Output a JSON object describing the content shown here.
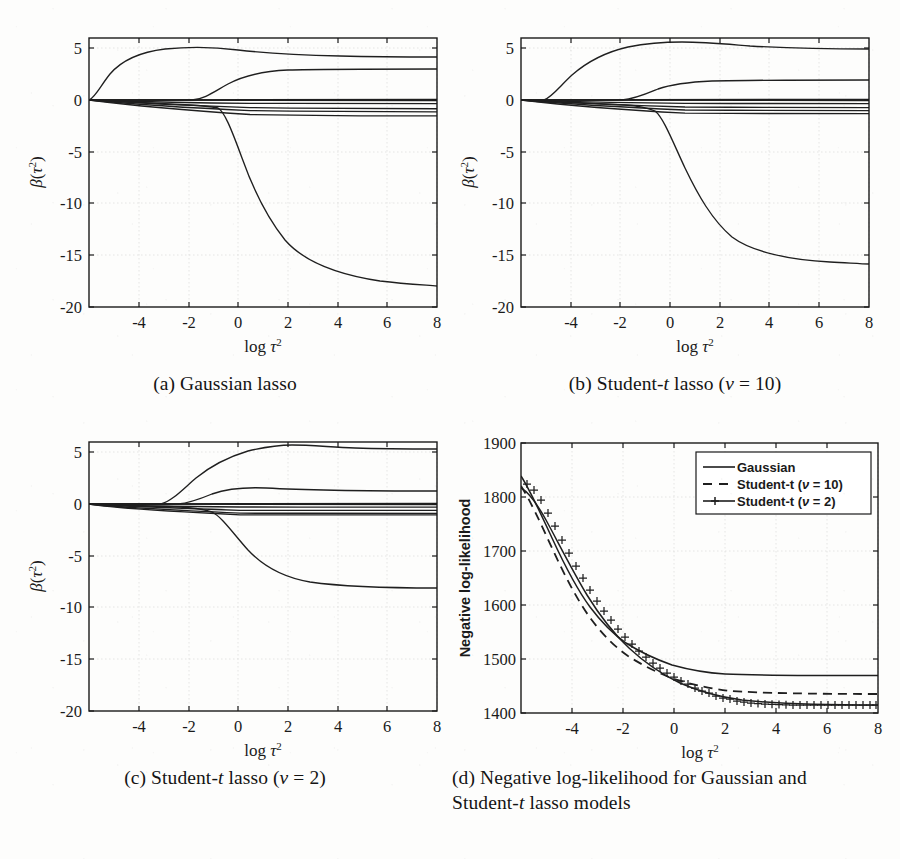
{
  "figure": {
    "background_color": "#fdfdfc",
    "ink_color": "#1a1a1a",
    "grid_color": "#d8d8d8"
  },
  "panels": [
    {
      "key": "a",
      "caption_prefix": "(a)",
      "caption_text": "Gaussian lasso"
    },
    {
      "key": "b",
      "caption_prefix": "(b)",
      "caption_text": "Student-t lasso (ν = 10)"
    },
    {
      "key": "c",
      "caption_prefix": "(c)",
      "caption_text": "Student-t lasso (ν = 2)"
    },
    {
      "key": "d",
      "caption_prefix": "(d)",
      "caption_text": "Negative log-likelihood for Gaussian and Student-t lasso models"
    }
  ],
  "axis_labels": {
    "x": "log τ²",
    "y_coef": "β(τ²)",
    "y_nll": "Negative log-likelihood"
  },
  "legend": {
    "position": "top-right",
    "items": [
      {
        "label": "Gaussian",
        "style": "solid"
      },
      {
        "label": "Student-t (ν = 10)",
        "style": "dashed"
      },
      {
        "label": "Student-t (ν = 2)",
        "style": "solid-plus-markers"
      }
    ]
  },
  "chart_data": [
    {
      "type": "line",
      "panel": "a",
      "title": "(a) Gaussian lasso",
      "xlabel": "log τ²",
      "ylabel": "β(τ²)",
      "xlim": [
        -5,
        9
      ],
      "ylim": [
        -20,
        6
      ],
      "xticks": [
        -4,
        -2,
        0,
        2,
        4,
        6,
        8
      ],
      "yticks": [
        5,
        0,
        -5,
        -10,
        -15,
        -20
      ],
      "grid": true,
      "legend": null,
      "x": [
        -5,
        -4.5,
        -4,
        -3.5,
        -3,
        -2.5,
        -2,
        -1.5,
        -1,
        -0.5,
        0,
        1,
        2,
        3,
        4,
        5,
        6,
        7,
        8,
        9
      ],
      "series": [
        {
          "name": "beta-1 (rises to ~4.2 then settles ~3.6)",
          "values": [
            0.0,
            0.6,
            1.9,
            2.9,
            3.5,
            3.9,
            4.1,
            4.2,
            4.25,
            4.25,
            4.2,
            4.0,
            3.85,
            3.75,
            3.7,
            3.67,
            3.65,
            3.63,
            3.62,
            3.6
          ]
        },
        {
          "name": "beta-2 (enters near -1.9, settles ~2.3)",
          "values": [
            0.0,
            0.0,
            0.0,
            0.0,
            0.0,
            0.0,
            0.0,
            0.55,
            1.2,
            1.7,
            2.0,
            2.25,
            2.3,
            2.3,
            2.3,
            2.3,
            2.3,
            2.3,
            2.3,
            2.3
          ]
        },
        {
          "name": "beta-3 (large negative, settles ~-17.8)",
          "values": [
            0.0,
            -0.05,
            -0.1,
            -0.15,
            -0.2,
            -0.28,
            -0.35,
            -0.45,
            -0.55,
            -0.7,
            -3.2,
            -8.4,
            -12.3,
            -14.8,
            -16.2,
            -17.0,
            -17.4,
            -17.6,
            -17.72,
            -17.8
          ]
        },
        {
          "name": "beta-4 (near zero, ~-0.05)",
          "values": [
            0.0,
            -0.01,
            -0.02,
            -0.03,
            -0.03,
            -0.04,
            -0.04,
            -0.05,
            -0.05,
            -0.05,
            -0.05,
            -0.05,
            -0.05,
            -0.05,
            -0.05,
            -0.05,
            -0.05,
            -0.05,
            -0.05,
            -0.05
          ]
        },
        {
          "name": "beta-5 (settles ~-0.35)",
          "values": [
            0.0,
            -0.05,
            -0.1,
            -0.14,
            -0.18,
            -0.21,
            -0.24,
            -0.27,
            -0.29,
            -0.31,
            -0.32,
            -0.34,
            -0.35,
            -0.35,
            -0.35,
            -0.35,
            -0.35,
            -0.35,
            -0.35,
            -0.35
          ]
        },
        {
          "name": "beta-6 (settles ~-0.8)",
          "values": [
            0.0,
            -0.08,
            -0.18,
            -0.27,
            -0.35,
            -0.42,
            -0.48,
            -0.55,
            -0.6,
            -0.65,
            -0.69,
            -0.74,
            -0.77,
            -0.79,
            -0.8,
            -0.8,
            -0.8,
            -0.8,
            -0.8,
            -0.8
          ]
        },
        {
          "name": "beta-7 (settles ~-1.1)",
          "values": [
            0.0,
            -0.1,
            -0.24,
            -0.37,
            -0.48,
            -0.58,
            -0.67,
            -0.75,
            -0.83,
            -0.9,
            -0.95,
            -1.02,
            -1.06,
            -1.08,
            -1.1,
            -1.1,
            -1.1,
            -1.1,
            -1.1,
            -1.1
          ]
        },
        {
          "name": "beta-8 (settles ~-1.45)",
          "values": [
            0.0,
            -0.14,
            -0.32,
            -0.48,
            -0.62,
            -0.75,
            -0.87,
            -0.98,
            -1.08,
            -1.16,
            -1.23,
            -1.33,
            -1.39,
            -1.42,
            -1.44,
            -1.45,
            -1.45,
            -1.45,
            -1.45,
            -1.45
          ]
        },
        {
          "name": "beta-9 (settles ~0.05)",
          "values": [
            0.0,
            0.01,
            0.02,
            0.03,
            0.03,
            0.04,
            0.04,
            0.05,
            0.05,
            0.05,
            0.05,
            0.05,
            0.05,
            0.05,
            0.05,
            0.05,
            0.05,
            0.05,
            0.05,
            0.05
          ]
        }
      ]
    },
    {
      "type": "line",
      "panel": "b",
      "title": "(b) Student-t lasso (ν = 10)",
      "xlabel": "log τ²",
      "ylabel": "β(τ²)",
      "xlim": [
        -5,
        9
      ],
      "ylim": [
        -20,
        6
      ],
      "xticks": [
        -4,
        -2,
        0,
        2,
        4,
        6,
        8
      ],
      "yticks": [
        5,
        0,
        -5,
        -10,
        -15,
        -20
      ],
      "grid": true,
      "legend": null,
      "x": [
        -5,
        -4.5,
        -4,
        -3.5,
        -3,
        -2.5,
        -2,
        -1.5,
        -1,
        -0.5,
        0,
        1,
        2,
        3,
        4,
        5,
        6,
        7,
        8,
        9
      ],
      "series": [
        {
          "name": "beta-1 (rises to ~5.3, settles ~4.9)",
          "values": [
            0.0,
            0.0,
            0.2,
            1.6,
            2.9,
            3.8,
            4.5,
            4.9,
            5.15,
            5.28,
            5.33,
            5.35,
            5.3,
            5.15,
            5.02,
            4.96,
            4.93,
            4.91,
            4.9,
            4.9
          ]
        },
        {
          "name": "beta-2 (enters ~-1.2, settles ~1.4)",
          "values": [
            0.0,
            0.0,
            0.0,
            0.0,
            0.0,
            0.0,
            0.0,
            0.0,
            0.2,
            0.65,
            0.95,
            1.25,
            1.36,
            1.4,
            1.41,
            1.41,
            1.41,
            1.41,
            1.41,
            1.41
          ]
        },
        {
          "name": "beta-3 (falls to ~-11.4)",
          "values": [
            0.0,
            -0.04,
            -0.1,
            -0.16,
            -0.22,
            -0.3,
            -0.38,
            -0.48,
            -0.6,
            -0.9,
            -2.6,
            -6.0,
            -8.6,
            -10.1,
            -10.8,
            -11.1,
            -11.25,
            -11.33,
            -11.37,
            -11.4
          ]
        },
        {
          "name": "beta-4 (near zero ~-0.05)",
          "values": [
            0.0,
            -0.01,
            -0.02,
            -0.03,
            -0.03,
            -0.04,
            -0.04,
            -0.05,
            -0.05,
            -0.05,
            -0.05,
            -0.05,
            -0.05,
            -0.05,
            -0.05,
            -0.05,
            -0.05,
            -0.05,
            -0.05,
            -0.05
          ]
        },
        {
          "name": "beta-5 (settles ~-0.35)",
          "values": [
            0.0,
            -0.04,
            -0.1,
            -0.14,
            -0.18,
            -0.21,
            -0.24,
            -0.27,
            -0.29,
            -0.31,
            -0.32,
            -0.34,
            -0.35,
            -0.35,
            -0.35,
            -0.35,
            -0.35,
            -0.35,
            -0.35,
            -0.35
          ]
        },
        {
          "name": "beta-6 (settles ~-0.7)",
          "values": [
            0.0,
            -0.07,
            -0.16,
            -0.25,
            -0.32,
            -0.39,
            -0.45,
            -0.5,
            -0.55,
            -0.59,
            -0.62,
            -0.66,
            -0.69,
            -0.7,
            -0.7,
            -0.7,
            -0.7,
            -0.7,
            -0.7,
            -0.7
          ]
        },
        {
          "name": "beta-7 (settles ~-1.0)",
          "values": [
            0.0,
            -0.1,
            -0.22,
            -0.34,
            -0.44,
            -0.53,
            -0.61,
            -0.69,
            -0.76,
            -0.82,
            -0.87,
            -0.93,
            -0.97,
            -0.99,
            -1.0,
            -1.0,
            -1.0,
            -1.0,
            -1.0,
            -1.0
          ]
        },
        {
          "name": "beta-8 (settles ~-1.3)",
          "values": [
            0.0,
            -0.13,
            -0.29,
            -0.43,
            -0.56,
            -0.68,
            -0.78,
            -0.88,
            -0.97,
            -1.04,
            -1.1,
            -1.19,
            -1.25,
            -1.28,
            -1.3,
            -1.3,
            -1.3,
            -1.3,
            -1.3,
            -1.3
          ]
        },
        {
          "name": "beta-9 (settles ~0.06)",
          "values": [
            0.0,
            0.01,
            0.02,
            0.03,
            0.04,
            0.04,
            0.05,
            0.05,
            0.06,
            0.06,
            0.06,
            0.06,
            0.06,
            0.06,
            0.06,
            0.06,
            0.06,
            0.06,
            0.06,
            0.06
          ]
        }
      ]
    },
    {
      "type": "line",
      "panel": "c",
      "title": "(c) Student-t lasso (ν = 2)",
      "xlabel": "log τ²",
      "ylabel": "β(τ²)",
      "xlim": [
        -5,
        9
      ],
      "ylim": [
        -20,
        6
      ],
      "xticks": [
        -4,
        -2,
        0,
        2,
        4,
        6,
        8
      ],
      "yticks": [
        5,
        0,
        -5,
        -10,
        -15,
        -20
      ],
      "grid": true,
      "legend": null,
      "x": [
        -5,
        -4.5,
        -4,
        -3.5,
        -3,
        -2.5,
        -2,
        -1.5,
        -1,
        -0.5,
        0,
        1,
        2,
        3,
        4,
        5,
        6,
        7,
        8,
        9
      ],
      "series": [
        {
          "name": "beta-1 (rises to ~5.8, settles ~5.5)",
          "values": [
            0.0,
            0.0,
            0.0,
            0.0,
            0.05,
            1.1,
            2.4,
            3.4,
            4.3,
            4.9,
            5.3,
            5.7,
            5.8,
            5.72,
            5.62,
            5.56,
            5.53,
            5.51,
            5.5,
            5.5
          ]
        },
        {
          "name": "beta-2 (enters ~-1.1, settles ~1.15)",
          "values": [
            0.0,
            0.0,
            0.0,
            0.0,
            0.0,
            0.0,
            0.0,
            -0.02,
            0.1,
            0.55,
            0.9,
            1.25,
            1.4,
            1.38,
            1.3,
            1.22,
            1.18,
            1.16,
            1.15,
            1.15
          ]
        },
        {
          "name": "beta-3 (falls to ~-6.9)",
          "values": [
            0.0,
            -0.02,
            -0.06,
            -0.1,
            -0.15,
            -0.22,
            -0.3,
            -0.4,
            -0.55,
            -0.85,
            -1.5,
            -3.0,
            -4.4,
            -5.5,
            -6.2,
            -6.6,
            -6.78,
            -6.85,
            -6.88,
            -6.9
          ]
        },
        {
          "name": "beta-4 (near zero ~-0.05)",
          "values": [
            0.0,
            -0.01,
            -0.02,
            -0.03,
            -0.03,
            -0.04,
            -0.04,
            -0.05,
            -0.05,
            -0.05,
            -0.05,
            -0.05,
            -0.05,
            -0.05,
            -0.05,
            -0.05,
            -0.05,
            -0.05,
            -0.05,
            -0.05
          ]
        },
        {
          "name": "beta-5 (settles ~-0.3)",
          "values": [
            0.0,
            -0.03,
            -0.08,
            -0.12,
            -0.15,
            -0.18,
            -0.21,
            -0.23,
            -0.25,
            -0.27,
            -0.28,
            -0.29,
            -0.3,
            -0.3,
            -0.3,
            -0.3,
            -0.3,
            -0.3,
            -0.3,
            -0.3
          ]
        },
        {
          "name": "beta-6 (settles ~-0.62)",
          "values": [
            0.0,
            -0.06,
            -0.14,
            -0.21,
            -0.28,
            -0.34,
            -0.39,
            -0.44,
            -0.48,
            -0.52,
            -0.55,
            -0.58,
            -0.6,
            -0.61,
            -0.62,
            -0.62,
            -0.62,
            -0.62,
            -0.62,
            -0.62
          ]
        },
        {
          "name": "beta-7 (settles ~-0.9)",
          "values": [
            0.0,
            -0.09,
            -0.2,
            -0.3,
            -0.4,
            -0.48,
            -0.55,
            -0.62,
            -0.68,
            -0.73,
            -0.78,
            -0.84,
            -0.87,
            -0.89,
            -0.9,
            -0.9,
            -0.9,
            -0.9,
            -0.9,
            -0.9
          ]
        },
        {
          "name": "beta-8 (settles ~-1.05)",
          "values": [
            0.0,
            -0.11,
            -0.24,
            -0.36,
            -0.46,
            -0.56,
            -0.64,
            -0.72,
            -0.79,
            -0.85,
            -0.9,
            -0.97,
            -1.01,
            -1.03,
            -1.05,
            -1.05,
            -1.05,
            -1.05,
            -1.05,
            -1.05
          ]
        },
        {
          "name": "beta-9 (settles ~0.05)",
          "values": [
            0.0,
            0.01,
            0.02,
            0.03,
            0.03,
            0.04,
            0.04,
            0.05,
            0.05,
            0.05,
            0.05,
            0.05,
            0.05,
            0.05,
            0.05,
            0.05,
            0.05,
            0.05,
            0.05,
            0.05
          ]
        }
      ]
    },
    {
      "type": "line",
      "panel": "d",
      "title": "(d) Negative log-likelihood for Gaussian and Student-t lasso models",
      "xlabel": "log τ²",
      "ylabel": "Negative log-likelihood",
      "xlim": [
        -5,
        9
      ],
      "ylim": [
        1400,
        1900
      ],
      "xticks": [
        -4,
        -2,
        0,
        2,
        4,
        6,
        8
      ],
      "yticks": [
        1400,
        1500,
        1600,
        1700,
        1800,
        1900
      ],
      "grid": true,
      "legend_position": "top-right",
      "x": [
        -5,
        -4.75,
        -4.5,
        -4.25,
        -4,
        -3.75,
        -3.5,
        -3.25,
        -3,
        -2.75,
        -2.5,
        -2.25,
        -2,
        -1.75,
        -1.5,
        -1.25,
        -1,
        -0.75,
        -0.5,
        0,
        0.5,
        1,
        1.5,
        2,
        2.5,
        3,
        3.5,
        4,
        5,
        6,
        7,
        8,
        9
      ],
      "series": [
        {
          "name": "Gaussian",
          "style": "solid",
          "values": [
            1838,
            1810,
            1780,
            1748,
            1714,
            1680,
            1648,
            1618,
            1592,
            1572,
            1556,
            1544,
            1533,
            1525,
            1519,
            1513,
            1508,
            1505,
            1503,
            1500,
            1499,
            1498,
            1497,
            1496,
            1496,
            1495,
            1495,
            1495,
            1495,
            1495,
            1495,
            1495,
            1495
          ]
        },
        {
          "name": "Student-t (ν = 10)",
          "style": "dashed",
          "values": [
            1820,
            1796,
            1770,
            1740,
            1708,
            1676,
            1644,
            1613,
            1585,
            1560,
            1538,
            1522,
            1510,
            1500,
            1492,
            1485,
            1479,
            1474,
            1470,
            1464,
            1459,
            1456,
            1453,
            1451,
            1450,
            1449,
            1448,
            1448,
            1447,
            1447,
            1447,
            1447,
            1447
          ]
        },
        {
          "name": "Student-t (ν = 2)",
          "style": "solid-plus-markers",
          "values": [
            1815,
            1810,
            1790,
            1763,
            1733,
            1702,
            1671,
            1640,
            1610,
            1583,
            1559,
            1538,
            1520,
            1505,
            1493,
            1482,
            1473,
            1465,
            1458,
            1447,
            1438,
            1431,
            1425,
            1420,
            1417,
            1415,
            1413,
            1412,
            1411,
            1410,
            1410,
            1410,
            1410
          ]
        }
      ]
    }
  ]
}
